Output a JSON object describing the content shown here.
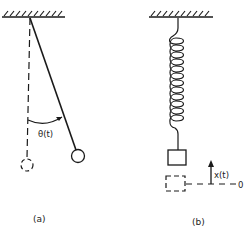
{
  "figure": {
    "panel_a": {
      "caption": "(a)",
      "angle_label": "θ(t)",
      "description": "Simple pendulum displaced by angle from vertical"
    },
    "panel_b": {
      "caption": "(b)",
      "displacement_label": "x(t)",
      "reference_label": "0",
      "description": "Mass on spring displaced from equilibrium"
    },
    "colors": {
      "stroke": "#1a1a1a",
      "background": "#ffffff"
    }
  }
}
